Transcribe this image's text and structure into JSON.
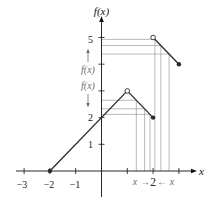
{
  "figure": {
    "y_axis_title": "f(x)",
    "x_axis_title": "x",
    "y_tick_labels": [
      {
        "value": 5,
        "label": "5"
      },
      {
        "value": 2,
        "label": "2"
      },
      {
        "value": 1,
        "label": "1"
      }
    ],
    "x_tick_labels": [
      {
        "value": -3,
        "label": "−3"
      },
      {
        "value": -2,
        "label": "−2"
      },
      {
        "value": -1,
        "label": "−1"
      }
    ],
    "x_annotation": {
      "left_var": "x",
      "right_arrow": "→",
      "center_value": "2",
      "left_arrow": "←",
      "right_var": "x"
    },
    "y_annotation": {
      "upper_arrow_icon": "arrow-up-icon",
      "upper_label": "f(x)",
      "lower_label": "f(x)",
      "lower_arrow_icon": "arrow-down-icon"
    }
  },
  "colors": {
    "background": "#ffffff",
    "axis": "#111111",
    "curve": "#2a2a2a",
    "guide": "#8c8c8c",
    "annotation": "#6a6a6a"
  },
  "chart_data": {
    "type": "line",
    "title": "",
    "xlabel": "x",
    "ylabel": "f(x)",
    "xlim": [
      -3.3,
      3.65
    ],
    "ylim": [
      -0.97,
      5.77
    ],
    "grid": false,
    "legend": null,
    "x_ticks": [
      -3,
      -2,
      -1,
      1,
      2,
      3
    ],
    "y_ticks": [
      1,
      2,
      3,
      4,
      5
    ],
    "series": [
      {
        "name": "f(x) piece 1",
        "x": [
          -2,
          1
        ],
        "y": [
          0,
          3
        ]
      },
      {
        "name": "f(x) piece 2",
        "x": [
          1,
          2
        ],
        "y": [
          3,
          2
        ]
      },
      {
        "name": "f(x) piece 3",
        "x": [
          2,
          3
        ],
        "y": [
          5,
          4
        ]
      }
    ],
    "points": [
      {
        "x": -2,
        "y": 0,
        "style": "closed"
      },
      {
        "x": 1,
        "y": 3,
        "style": "open"
      },
      {
        "x": 2,
        "y": 2,
        "style": "closed"
      },
      {
        "x": 2,
        "y": 5,
        "style": "open"
      },
      {
        "x": 3,
        "y": 4,
        "style": "closed"
      }
    ],
    "guide_points": [
      {
        "x": 1.35,
        "y": 2.65,
        "side": "left"
      },
      {
        "x": 1.67,
        "y": 2.33,
        "side": "left"
      },
      {
        "x": 1.88,
        "y": 2.12,
        "side": "left"
      },
      {
        "x": 2.07,
        "y": 4.93,
        "side": "right"
      },
      {
        "x": 2.3,
        "y": 4.7,
        "side": "right"
      },
      {
        "x": 2.62,
        "y": 4.38,
        "side": "right"
      }
    ],
    "annotations": [
      "x → 2 ← x (x approaches 2 from left and right)",
      "f(x) ↑ (limit from right approaches 5)",
      "f(x) ↓ (limit from left approaches 2)"
    ]
  }
}
